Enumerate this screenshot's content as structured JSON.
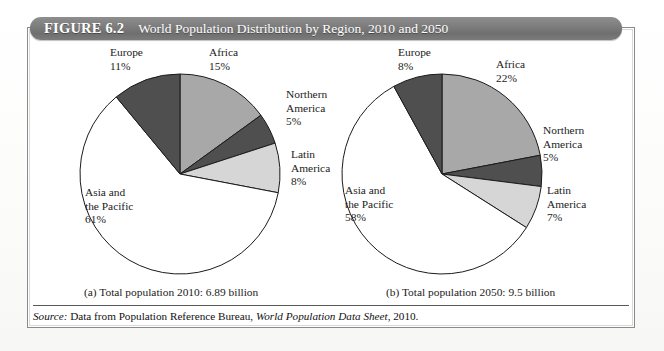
{
  "figure": {
    "number": "FIGURE 6.2",
    "title": "World Population Distribution by Region, 2010 and 2050"
  },
  "captions": {
    "a": "(a) Total population 2010: 6.89 billion",
    "b": "(b) Total population 2050: 9.5 billion"
  },
  "source": {
    "label": "Source:",
    "text": "Data from Population Reference Bureau,",
    "publication": "World Population Data Sheet",
    "year": ", 2010."
  },
  "colors": {
    "africa": "#a8a8a8",
    "northern_america": "#4f4f4f",
    "latin_america": "#d6d6d6",
    "asia_pacific": "#ffffff",
    "europe": "#4f4f4f",
    "outline": "#1b1b1b",
    "header_text": "#ffffff",
    "text": "#1b1b1b"
  },
  "chart_data": [
    {
      "type": "pie",
      "id": "pie-2010",
      "title": "(a) Total population 2010: 6.89 billion",
      "total_population": "6.89 billion",
      "year": "2010",
      "start_angle_deg": 0,
      "direction": "clockwise",
      "center": {
        "x": 152,
        "y": 132
      },
      "radius": 100,
      "categories": [
        "Africa",
        "Northern America",
        "Latin America",
        "Asia and the Pacific",
        "Europe"
      ],
      "values": [
        15,
        5,
        8,
        61,
        11
      ],
      "labels": [
        {
          "name": "Africa",
          "value": 15,
          "text": "Africa",
          "percent": "15%",
          "x": 181,
          "y": 14,
          "anchor": "start"
        },
        {
          "name": "Northern America",
          "value": 5,
          "text": "Northern\nAmerica",
          "percent": "5%",
          "x": 258,
          "y": 56,
          "anchor": "start"
        },
        {
          "name": "Latin America",
          "value": 8,
          "text": "Latin\nAmerica",
          "percent": "8%",
          "x": 263,
          "y": 116,
          "anchor": "start"
        },
        {
          "name": "Asia and the Pacific",
          "value": 61,
          "text": "Asia and\nthe Pacific",
          "percent": "61%",
          "x": 57,
          "y": 154,
          "anchor": "start"
        },
        {
          "name": "Europe",
          "value": 11,
          "text": "Europe",
          "percent": "11%",
          "x": 82,
          "y": 14,
          "anchor": "start"
        }
      ]
    },
    {
      "type": "pie",
      "id": "pie-2050",
      "title": "(b) Total population 2050: 9.5 billion",
      "total_population": "9.5 billion",
      "year": "2050",
      "start_angle_deg": 0,
      "direction": "clockwise",
      "center": {
        "x": 414,
        "y": 132
      },
      "radius": 100,
      "categories": [
        "Africa",
        "Northern America",
        "Latin America",
        "Asia and the Pacific",
        "Europe"
      ],
      "values": [
        22,
        5,
        7,
        58,
        8
      ],
      "labels": [
        {
          "name": "Africa",
          "value": 22,
          "text": "Africa",
          "percent": "22%",
          "x": 468,
          "y": 26,
          "anchor": "start"
        },
        {
          "name": "Northern America",
          "value": 5,
          "text": "Northern\nAmerica",
          "percent": "5%",
          "x": 515,
          "y": 92,
          "anchor": "start"
        },
        {
          "name": "Latin America",
          "value": 7,
          "text": "Latin\nAmerica",
          "percent": "7%",
          "x": 519,
          "y": 152,
          "anchor": "start"
        },
        {
          "name": "Asia and the Pacific",
          "value": 58,
          "text": "Asia and\nthe Pacific",
          "percent": "58%",
          "x": 317,
          "y": 152,
          "anchor": "start"
        },
        {
          "name": "Europe",
          "value": 8,
          "text": "Europe",
          "percent": "8%",
          "x": 370,
          "y": 14,
          "anchor": "start"
        }
      ]
    }
  ]
}
